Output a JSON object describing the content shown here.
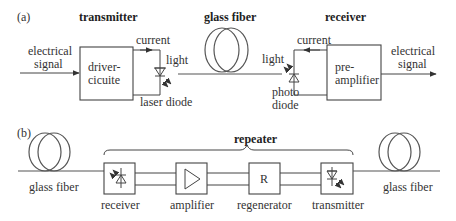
{
  "panel_a": {
    "tag": "(a)",
    "transmitter_title": "transmitter",
    "fiber_title": "glass fiber",
    "receiver_title": "receiver",
    "input_label_1": "electrical",
    "input_label_2": "signal",
    "driver_label_1": "driver-",
    "driver_label_2": "cicuite",
    "current_tx": "current",
    "light_tx": "light",
    "laser_diode": "laser diode",
    "light_rx": "light",
    "current_rx": "current",
    "photo_1": "photo",
    "photo_2": "diode",
    "preamp_1": "pre-",
    "preamp_2": "amplifier",
    "output_label_1": "electrical",
    "output_label_2": "signal"
  },
  "panel_b": {
    "tag": "(b)",
    "repeater_title": "repeater",
    "left_fiber": "glass fiber",
    "right_fiber": "glass fiber",
    "blocks": [
      {
        "label": "receiver",
        "symbol": "photodiode"
      },
      {
        "label": "amplifier",
        "symbol": "triangle"
      },
      {
        "label": "regenerator",
        "symbol": "R"
      },
      {
        "label": "transmitter",
        "symbol": "laserdiode"
      }
    ]
  }
}
